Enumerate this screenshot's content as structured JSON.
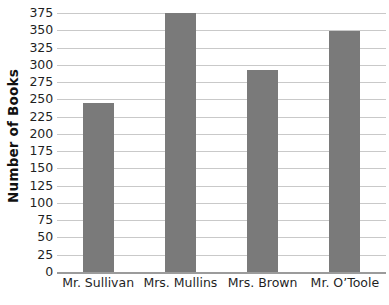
{
  "chart_data": {
    "type": "bar",
    "title": "",
    "subtitle": "",
    "xlabel": "",
    "ylabel": "Number of Books",
    "categories": [
      "Mr. Sullivan",
      "Mrs. Mullins",
      "Mrs. Brown",
      "Mr. O’Toole"
    ],
    "values": [
      244,
      375,
      293,
      349
    ],
    "ylim": [
      0,
      375
    ],
    "ytick_step": 25,
    "ytick_labels": [
      "0",
      "25",
      "50",
      "75",
      "100",
      "125",
      "150",
      "175",
      "200",
      "225",
      "250",
      "275",
      "300",
      "325",
      "350",
      "375"
    ],
    "ytick_values": [
      0,
      25,
      50,
      75,
      100,
      125,
      150,
      175,
      200,
      225,
      250,
      275,
      300,
      325,
      350,
      375
    ],
    "grid": true,
    "grid_axis": "y",
    "legend": false,
    "legend_position": "none",
    "bar_color": "#7a7a7a",
    "gridline_color": "#c9c9c9",
    "axis_color": "#9b9b9b",
    "background_color": "#ffffff",
    "text_color": "#1f1f1f"
  }
}
